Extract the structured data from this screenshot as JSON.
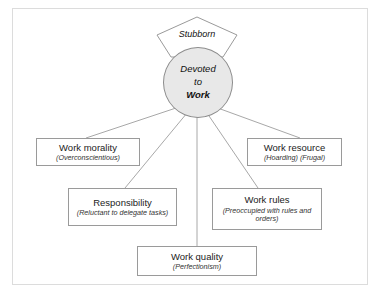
{
  "diagram": {
    "apex": {
      "label": "Stubborn",
      "shape": "pentagon"
    },
    "core": {
      "line1": "Devoted",
      "line2": "to",
      "line3": "Work",
      "fill": "#e8e8e8"
    },
    "nodes": [
      {
        "title": "Work morality",
        "sub": "(Overconscientious)"
      },
      {
        "title": "Work resource",
        "sub": "(Hoarding) (Frugal)"
      },
      {
        "title": "Responsibility",
        "sub": "(Reluctant to delegate tasks)"
      },
      {
        "title": "Work rules",
        "sub": "(Preoccupied with rules and orders)"
      },
      {
        "title": "Work quality",
        "sub": "(Perfectionism)"
      }
    ],
    "colors": {
      "stroke": "#9a9a9a",
      "frame": "#dcdcdc",
      "wire": "#a8a8a8"
    }
  }
}
